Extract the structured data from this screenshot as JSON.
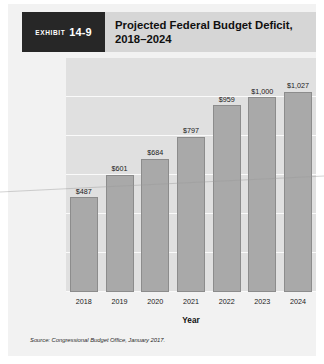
{
  "exhibit": {
    "badge_word": "Exhibit",
    "badge_number": "14-9",
    "title_line1": "Projected Federal Budget Deficit,",
    "title_line2": "2018–2024"
  },
  "source_note": "Source: Congressional Budget Office, January 2017.",
  "colors": {
    "badge_background": "#272727",
    "header_band": "#d6d6d6",
    "panel_background": "#f2f2f2",
    "plot_background": "#e0e0e0",
    "bar_fill": "#a9a9a9",
    "bar_border": "#8c8c8c",
    "gridline": "#fafafa"
  },
  "chart_data": {
    "type": "bar",
    "title": "Projected Federal Budget Deficit, 2018–2024",
    "xlabel": "Year",
    "ylabel": "Budget deficit (in billions of dollars)",
    "categories": [
      "2018",
      "2019",
      "2020",
      "2021",
      "2022",
      "2023",
      "2024"
    ],
    "values": [
      487,
      601,
      684,
      797,
      959,
      1000,
      1027
    ],
    "value_labels": [
      "$487",
      "$601",
      "$684",
      "$797",
      "$959",
      "$1,000",
      "$1,027"
    ],
    "ylim": [
      0,
      1200
    ],
    "ytick_values": [
      0,
      200,
      400,
      600,
      800,
      1000,
      1200
    ],
    "ytick_labels": [
      "0",
      "$200",
      "$400",
      "$600",
      "$800",
      "$1,000",
      "$1,200"
    ],
    "grid": true,
    "legend": false,
    "source": "Congressional Budget Office, January 2017."
  }
}
